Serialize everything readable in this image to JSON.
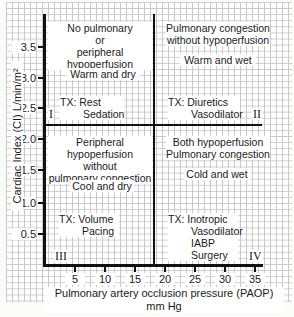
{
  "axes": {
    "y_title": "Cardiac Index (CI) L/min/m²",
    "x_title": "Pulmonary artery occlusion pressure (PAOP) mm Hg",
    "y_ticks": [
      "3.5",
      "3.0",
      "2.5",
      "2.0",
      "1.5",
      "1.0",
      "0.5"
    ],
    "x_ticks": [
      "5",
      "10",
      "15",
      "20",
      "25",
      "30",
      "35"
    ],
    "y_threshold": 2.2,
    "x_threshold": 18
  },
  "quadrants": [
    {
      "id": "I",
      "heading": [
        "No pulmonary",
        "or",
        "peripheral hypoperfusion"
      ],
      "profile": "Warm and dry",
      "tx": [
        "TX: Rest",
        "Sedation"
      ]
    },
    {
      "id": "II",
      "heading": [
        "Pulmonary congestion",
        "without hypoperfusion"
      ],
      "profile": "Warm and wet",
      "tx": [
        "TX: Diuretics",
        "Vasodilator"
      ]
    },
    {
      "id": "III",
      "heading": [
        "Peripheral hypoperfusion",
        "without",
        "pulmonary congestion"
      ],
      "profile": "Cool and dry",
      "tx": [
        "TX: Volume",
        "Pacing"
      ]
    },
    {
      "id": "IV",
      "heading": [
        "Both hypoperfusion",
        "Pulmonary congestion"
      ],
      "profile": "Cold and wet",
      "tx": [
        "TX: Inotropic",
        "Vasodilator",
        "IABP",
        "Surgery"
      ]
    }
  ],
  "colors": {
    "grid": "#c9c9c9",
    "axis": "#111111",
    "background": "#ffffff"
  }
}
